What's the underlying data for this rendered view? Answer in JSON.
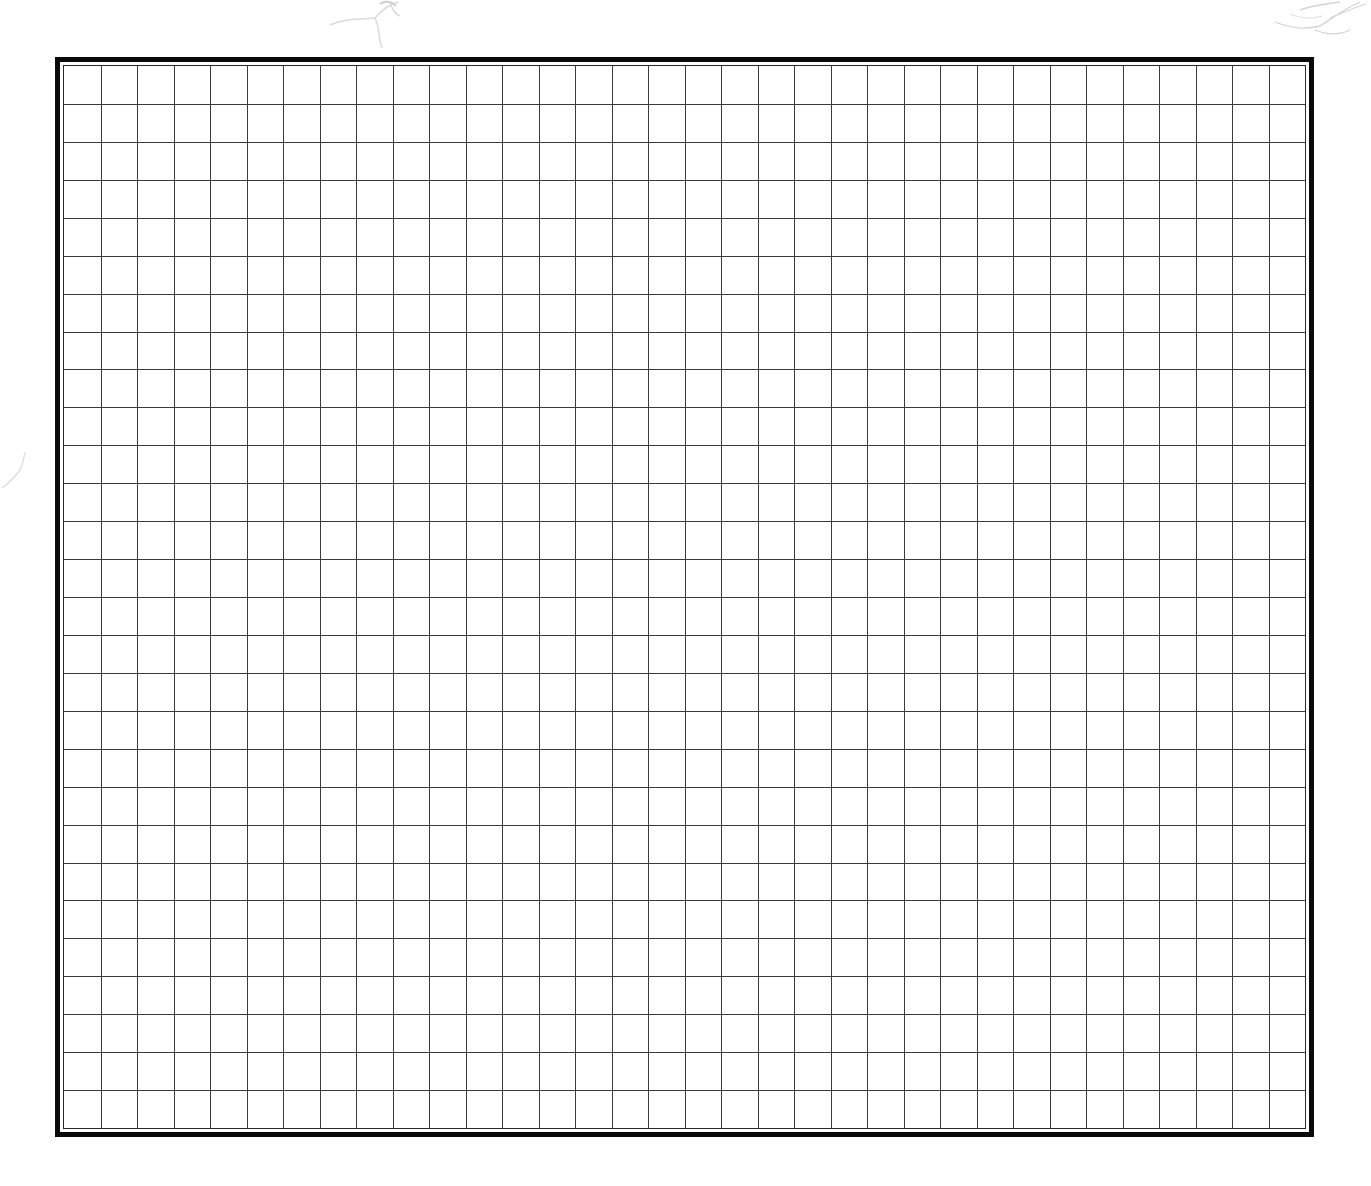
{
  "grid": {
    "columns": 34,
    "rows": 28,
    "line_color": "#3a3a3a",
    "outer_border_color": "#0a0a0a",
    "inner_border_color": "#2a2a2a",
    "background": "#ffffff"
  },
  "decorations": [
    {
      "name": "sketch-top-center",
      "color": "#d8d8d8"
    },
    {
      "name": "sketch-top-right",
      "color": "#d0d0d0"
    },
    {
      "name": "sketch-left-edge",
      "color": "#dcdcdc"
    }
  ]
}
